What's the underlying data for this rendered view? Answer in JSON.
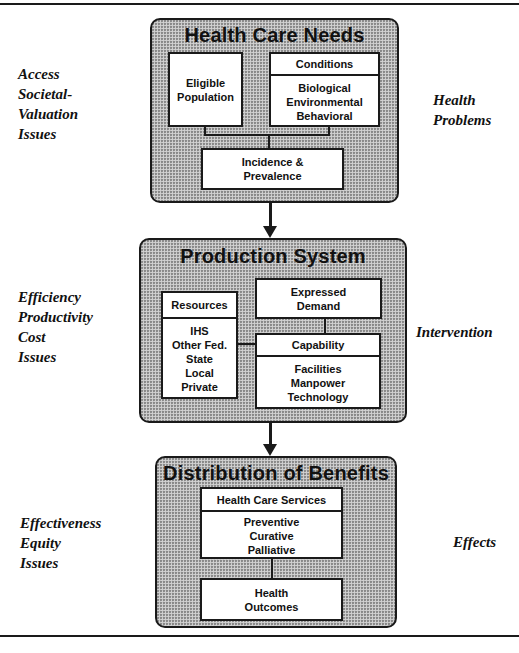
{
  "diagram": {
    "sections": [
      {
        "title": "Health Care Needs",
        "left_label": [
          "Access",
          "Societal-",
          "Valuation",
          "Issues"
        ],
        "right_label": [
          "Health",
          "Problems"
        ],
        "boxes": {
          "eligible": [
            "Eligible",
            "Population"
          ],
          "conditions_header": "Conditions",
          "conditions_body": [
            "Biological",
            "Environmental",
            "Behavioral"
          ],
          "incidence": [
            "Incidence &",
            "Prevalence"
          ]
        }
      },
      {
        "title": "Production System",
        "left_label": [
          "Efficiency",
          "Productivity",
          "Cost",
          "Issues"
        ],
        "right_label": [
          "Intervention"
        ],
        "boxes": {
          "resources_header": "Resources",
          "resources_body": [
            "IHS",
            "Other Fed.",
            "State",
            "Local",
            "Private"
          ],
          "demand": [
            "Expressed",
            "Demand"
          ],
          "capability_header": "Capability",
          "capability_body": [
            "Facilities",
            "Manpower",
            "Technology"
          ]
        }
      },
      {
        "title": "Distribution of Benefits",
        "left_label": [
          "Effectiveness",
          "Equity",
          "Issues"
        ],
        "right_label": [
          "Effects"
        ],
        "boxes": {
          "services_header": "Health Care Services",
          "services_body": [
            "Preventive",
            "Curative",
            "Palliative"
          ],
          "outcomes": [
            "Health",
            "Outcomes"
          ]
        }
      }
    ]
  }
}
